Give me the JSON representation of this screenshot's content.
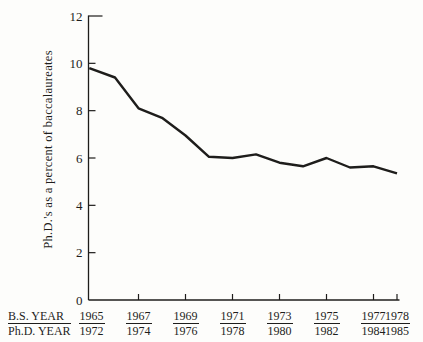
{
  "figure": {
    "background": "#fdfdfb",
    "ink_color": "#1e1d1b"
  },
  "chart_data": {
    "type": "line",
    "title": "",
    "ylabel": "Ph.D.'s as a percent of baccalaureates",
    "xlabel": "",
    "ylim": [
      0,
      12
    ],
    "yticks": [
      0,
      2,
      4,
      6,
      8,
      10,
      12
    ],
    "grid": false,
    "legend_position": "none",
    "x_axis_legend": {
      "top": "B.S. YEAR",
      "bottom": "Ph.D. YEAR"
    },
    "x_tick_labels": [
      {
        "bs": "1965",
        "phd": "1972",
        "has_tick": false
      },
      {
        "bs": "1967",
        "phd": "1974",
        "has_tick": true
      },
      {
        "bs": "1969",
        "phd": "1976",
        "has_tick": true
      },
      {
        "bs": "1971",
        "phd": "1978",
        "has_tick": true
      },
      {
        "bs": "1973",
        "phd": "1980",
        "has_tick": true
      },
      {
        "bs": "1975",
        "phd": "1982",
        "has_tick": true
      },
      {
        "bs": "1977",
        "phd": "1984",
        "has_tick": true
      },
      {
        "bs": "1978",
        "phd": "1985",
        "has_tick": true
      }
    ],
    "series": [
      {
        "name": "Ph.D.'s as a percent of baccalaureates",
        "x_bs_years": [
          1965,
          1966,
          1967,
          1968,
          1969,
          1970,
          1971,
          1972,
          1973,
          1974,
          1975,
          1976,
          1977,
          1978
        ],
        "x_phd_years": [
          1972,
          1973,
          1974,
          1975,
          1976,
          1977,
          1978,
          1979,
          1980,
          1981,
          1982,
          1983,
          1984,
          1985
        ],
        "values": [
          9.8,
          9.4,
          8.1,
          7.7,
          6.95,
          6.05,
          6.0,
          6.15,
          5.8,
          5.65,
          6.0,
          5.6,
          5.65,
          5.35
        ]
      }
    ]
  }
}
